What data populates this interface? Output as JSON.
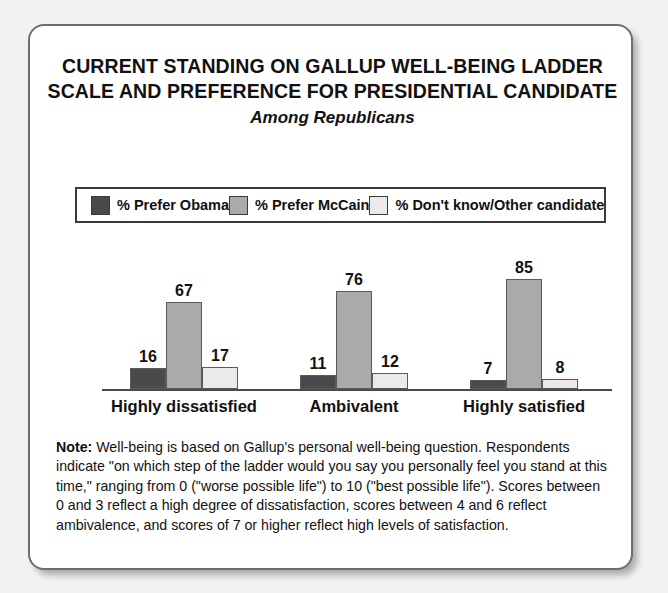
{
  "title": {
    "line1": "CURRENT STANDING ON GALLUP WELL-BEING LADDER",
    "line2": "SCALE AND PREFERENCE FOR PRESIDENTIAL CANDIDATE",
    "subtitle": "Among Republicans"
  },
  "legend": {
    "items": [
      {
        "label": "% Prefer Obama",
        "color": "#4a4a4a"
      },
      {
        "label": "% Prefer McCain",
        "color": "#aaaaaa"
      },
      {
        "label": "% Don't know/Other candidate",
        "color": "#eaeaea"
      }
    ]
  },
  "note": {
    "label": "Note:",
    "text": " Well-being is based on Gallup's personal well-being question. Respondents indicate \"on which step of the ladder would you say you personally feel you stand at this time,\" ranging from 0 (\"worse possible life\") to 10 (\"best possible life\"). Scores between 0 and 3 reflect a high degree of dissatisfaction, scores between 4 and 6 reflect ambivalence, and scores of 7 or higher reflect high levels of satisfaction."
  },
  "chart_data": {
    "type": "bar",
    "title": "CURRENT STANDING ON GALLUP WELL-BEING LADDER SCALE AND PREFERENCE FOR PRESIDENTIAL CANDIDATE",
    "subtitle": "Among Republicans",
    "xlabel": "",
    "ylabel": "",
    "ylim": [
      0,
      100
    ],
    "grid": false,
    "legend_position": "top",
    "categories": [
      "Highly dissatisfied",
      "Ambivalent",
      "Highly satisfied"
    ],
    "series": [
      {
        "name": "% Prefer Obama",
        "color": "#4a4a4a",
        "values": [
          16,
          11,
          7
        ]
      },
      {
        "name": "% Prefer McCain",
        "color": "#aaaaaa",
        "values": [
          67,
          76,
          85
        ]
      },
      {
        "name": "% Don't know/Other candidate",
        "color": "#eaeaea",
        "values": [
          17,
          12,
          8
        ]
      }
    ]
  }
}
